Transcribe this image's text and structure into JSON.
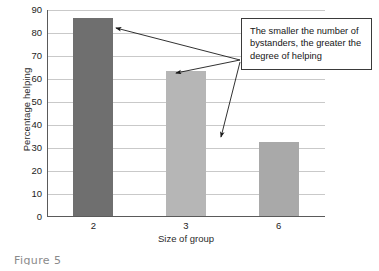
{
  "chart_data": {
    "type": "bar",
    "title": "",
    "subtitle": "",
    "categories": [
      "2",
      "3",
      "6"
    ],
    "values": [
      86,
      63,
      32
    ],
    "series": [
      {
        "name": "Percentage helping",
        "values": [
          86,
          63,
          32
        ]
      }
    ],
    "xlabel": "Size of group",
    "ylabel": "Percentage helping",
    "ylim": [
      0,
      90
    ],
    "xlim": null,
    "yticks": [
      0,
      10,
      20,
      30,
      40,
      50,
      60,
      70,
      80,
      90
    ],
    "ytick_labels": [
      "0",
      "10",
      "20",
      "30",
      "40",
      "50",
      "60",
      "70",
      "80",
      "90"
    ],
    "xtick_labels": [
      "2",
      "3",
      "6"
    ],
    "grid": "horizontal",
    "legend": null,
    "legend_position": "none",
    "bar_colors": [
      "#6f6f6f",
      "#b6b6b6",
      "#a9a9a9"
    ],
    "annotations": [
      {
        "text": "The smaller the number of bystanders, the greater the degree of helping",
        "points_to": [
          "2",
          "3",
          "6"
        ]
      }
    ]
  },
  "axes": {
    "y_title": "Percentage helping",
    "x_title": "Size of group",
    "y_ticks": [
      "90",
      "80",
      "70",
      "60",
      "50",
      "40",
      "30",
      "20",
      "10",
      "0"
    ],
    "x_ticks": [
      "2",
      "3",
      "6"
    ]
  },
  "callout": {
    "text": "The smaller the number of bystanders, the greater the degree of helping"
  },
  "caption": {
    "text": "Figure 5"
  },
  "colors": {
    "bar_dark": "#6f6f6f",
    "bar_light": "#b6b6b6",
    "bar_mid": "#a9a9a9",
    "gridline": "#c9c9c9",
    "axis": "#5a5a5a",
    "callout_border": "#3a3a3a",
    "background": "#ffffff"
  }
}
